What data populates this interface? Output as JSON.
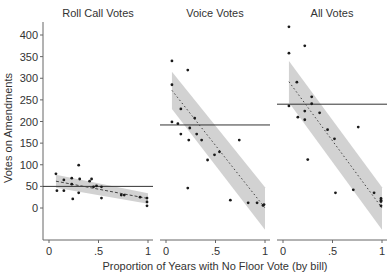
{
  "chart_data": {
    "type": "scatter",
    "ylabel": "Votes on Amendments",
    "xlabel": "Proportion of Years with No Floor Vote (by bill)",
    "yticks": [
      0,
      50,
      100,
      150,
      200,
      250,
      300,
      350,
      400
    ],
    "ytick_labels": [
      "0",
      "50",
      "100",
      "150",
      "200",
      "250",
      "300",
      "350",
      "400"
    ],
    "ylim": [
      -75,
      425
    ],
    "xticks": [
      0,
      0.5,
      1
    ],
    "xtick_labels": [
      "0",
      ".5",
      "1"
    ],
    "xlim": [
      -0.06,
      1.05
    ],
    "grid": false,
    "panels": [
      {
        "title": "Roll Call Votes",
        "mean_line": 50,
        "fit": {
          "x": [
            0.07,
            1.0
          ],
          "y": [
            62,
            22
          ]
        },
        "ci_band": {
          "x": [
            0.07,
            1.0
          ],
          "upper": [
            77,
            34
          ],
          "lower": [
            47,
            10
          ]
        },
        "points": [
          [
            0.07,
            79
          ],
          [
            0.08,
            40
          ],
          [
            0.15,
            65
          ],
          [
            0.15,
            40
          ],
          [
            0.23,
            69
          ],
          [
            0.23,
            55
          ],
          [
            0.24,
            21
          ],
          [
            0.3,
            99
          ],
          [
            0.3,
            35
          ],
          [
            0.31,
            67
          ],
          [
            0.41,
            62
          ],
          [
            0.43,
            67
          ],
          [
            0.45,
            49
          ],
          [
            0.48,
            51
          ],
          [
            0.53,
            49
          ],
          [
            0.53,
            23
          ],
          [
            0.73,
            30
          ],
          [
            0.76,
            30
          ],
          [
            0.92,
            25
          ],
          [
            0.99,
            23
          ],
          [
            0.99,
            14
          ],
          [
            0.99,
            5
          ]
        ]
      },
      {
        "title": "Voice Votes",
        "mean_line": 192,
        "fit": {
          "x": [
            0.06,
            1.0
          ],
          "y": [
            272,
            0
          ]
        },
        "ci_band": {
          "x": [
            0.06,
            1.0
          ],
          "upper": [
            315,
            48
          ],
          "lower": [
            229,
            -50
          ]
        },
        "points": [
          [
            0.06,
            340
          ],
          [
            0.22,
            319
          ],
          [
            0.06,
            285
          ],
          [
            0.15,
            229
          ],
          [
            0.29,
            208
          ],
          [
            0.06,
            199
          ],
          [
            0.12,
            195
          ],
          [
            0.24,
            185
          ],
          [
            0.15,
            171
          ],
          [
            0.31,
            171
          ],
          [
            0.23,
            157
          ],
          [
            0.36,
            157
          ],
          [
            0.49,
            123
          ],
          [
            0.54,
            130
          ],
          [
            0.42,
            111
          ],
          [
            0.74,
            157
          ],
          [
            0.22,
            46
          ],
          [
            0.65,
            18
          ],
          [
            0.83,
            12
          ],
          [
            0.92,
            12
          ],
          [
            0.98,
            6
          ],
          [
            0.99,
            8
          ]
        ]
      },
      {
        "title": "All Votes",
        "mean_line": 240,
        "fit": {
          "x": [
            0.06,
            1.0
          ],
          "y": [
            292,
            0
          ]
        },
        "ci_band": {
          "x": [
            0.06,
            1.0
          ],
          "upper": [
            340,
            48
          ],
          "lower": [
            244,
            -50
          ]
        },
        "points": [
          [
            0.06,
            419
          ],
          [
            0.22,
            375
          ],
          [
            0.06,
            358
          ],
          [
            0.14,
            291
          ],
          [
            0.29,
            257
          ],
          [
            0.06,
            236
          ],
          [
            0.15,
            210
          ],
          [
            0.22,
            224
          ],
          [
            0.22,
            204
          ],
          [
            0.29,
            241
          ],
          [
            0.37,
            220
          ],
          [
            0.45,
            181
          ],
          [
            0.52,
            160
          ],
          [
            0.76,
            187
          ],
          [
            0.25,
            112
          ],
          [
            0.53,
            35
          ],
          [
            0.71,
            42
          ],
          [
            0.92,
            35
          ],
          [
            0.99,
            22
          ],
          [
            0.99,
            18
          ],
          [
            0.99,
            15
          ],
          [
            0.99,
            5
          ]
        ]
      }
    ]
  },
  "colors": {
    "points": "#1a1a1a",
    "fit_line": "#444444",
    "ci_band": "#d2d2d2",
    "mean_line": "#333333",
    "axis": "#666666",
    "text": "#333333"
  }
}
